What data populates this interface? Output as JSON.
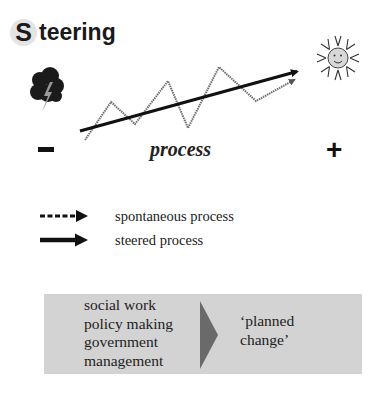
{
  "title": {
    "initial": "S",
    "rest": "teering"
  },
  "diagram": {
    "left_icon": "storm-cloud-icon",
    "right_icon": "smiling-sun-icon",
    "minus_sign": "−",
    "plus_sign": "+",
    "axis_label": "process",
    "steered_line": {
      "from": [
        80,
        131
      ],
      "to": [
        302,
        70
      ]
    },
    "spontaneous_path": [
      [
        85,
        140
      ],
      [
        111,
        102
      ],
      [
        135,
        124
      ],
      [
        168,
        81
      ],
      [
        188,
        128
      ],
      [
        219,
        67
      ],
      [
        256,
        101
      ],
      [
        298,
        78
      ]
    ],
    "colors": {
      "steered": "#111111",
      "spontaneous": "#6e6e6e"
    }
  },
  "legend": {
    "items": [
      {
        "style": "dashed-arrow",
        "label": "spontaneous process"
      },
      {
        "style": "solid-arrow",
        "label": "steered process"
      }
    ]
  },
  "box": {
    "actors": [
      "social work",
      "policy making",
      "government",
      "management"
    ],
    "result_lines": [
      "‘planned",
      "change’"
    ],
    "background": "#d3d3d3",
    "arrow_color": "#6a6a6a"
  }
}
